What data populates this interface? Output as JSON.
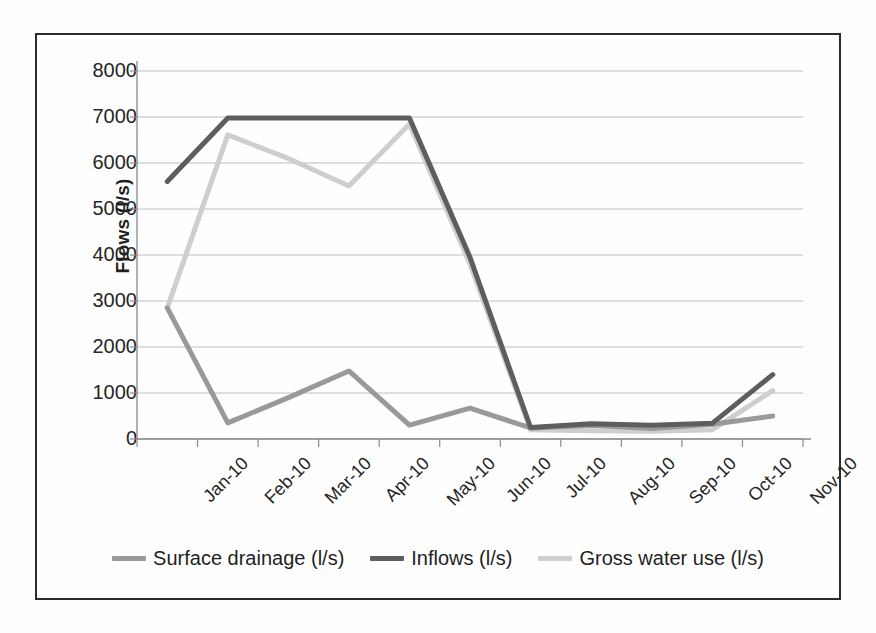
{
  "chart_data": {
    "type": "line",
    "title": "",
    "xlabel": "",
    "ylabel": "Flows (l/s)",
    "ylim": [
      0,
      8000
    ],
    "ytick_step": 1000,
    "yticks": [
      "8000",
      "7000",
      "6000",
      "5000",
      "4000",
      "3000",
      "2000",
      "1000",
      "0"
    ],
    "grid": true,
    "grid_axis": "y",
    "legend_position": "bottom",
    "categories": [
      "Jan-10",
      "Feb-10",
      "Mar-10",
      "Apr-10",
      "May-10",
      "Jun-10",
      "Jul-10",
      "Aug-10",
      "Sep-10",
      "Oct-10",
      "Nov-10"
    ],
    "series": [
      {
        "name": "Surface drainage (l/s)",
        "color": "#9a9a9a",
        "values": [
          2850,
          350,
          900,
          1480,
          300,
          670,
          240,
          300,
          230,
          320,
          500
        ]
      },
      {
        "name": "Inflows (l/s)",
        "color": "#5e5e5e",
        "values": [
          5600,
          6980,
          6980,
          6980,
          6980,
          3950,
          250,
          330,
          300,
          340,
          1400
        ]
      },
      {
        "name": "Gross water use (l/s)",
        "color": "#cfcfcf",
        "values": [
          2850,
          6610,
          6100,
          5500,
          6850,
          3800,
          200,
          180,
          170,
          200,
          1050
        ]
      }
    ]
  },
  "axes": {
    "y_title": "Flows (l/s)"
  },
  "legend": {
    "entries": [
      {
        "label": "Surface drainage (l/s)",
        "color": "#9a9a9a"
      },
      {
        "label": "Inflows (l/s)",
        "color": "#5e5e5e"
      },
      {
        "label": "Gross water use (l/s)",
        "color": "#cfcfcf"
      }
    ]
  },
  "colors": {
    "frame": "#2b2b2b",
    "gridline": "#bfbfbf",
    "axis": "#8a8a8a",
    "text": "#262626",
    "background": "#ffffff"
  }
}
